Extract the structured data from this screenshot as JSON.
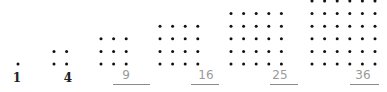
{
  "colors": {
    "dot": "#111111",
    "dark_label": "#222222",
    "light_label": "#9a9a9a",
    "underline": "#8a8a8a"
  },
  "figures": [
    {
      "n": 1,
      "label": "1",
      "style": "dark"
    },
    {
      "n": 2,
      "label": "4",
      "style": "dark"
    },
    {
      "n": 3,
      "label": "9",
      "style": "light-underlined"
    },
    {
      "n": 4,
      "label": "16",
      "style": "light-underlined"
    },
    {
      "n": 5,
      "label": "25",
      "style": "light-underlined"
    },
    {
      "n": 6,
      "label": "36",
      "style": "light-underlined"
    }
  ]
}
